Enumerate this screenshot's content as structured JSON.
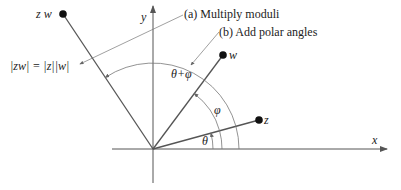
{
  "diagram": {
    "type": "complex-multiplication-geometry",
    "axes": {
      "x_label": "x",
      "y_label": "y"
    },
    "points": [
      {
        "id": "z",
        "label": "z"
      },
      {
        "id": "w",
        "label": "w"
      },
      {
        "id": "zw",
        "label": "z w"
      }
    ],
    "angles": [
      {
        "id": "theta",
        "label": "θ"
      },
      {
        "id": "phi",
        "label": "φ"
      },
      {
        "id": "theta_plus_phi",
        "label": "θ+φ"
      }
    ],
    "annotations": {
      "a": "(a)  Multiply moduli",
      "b": "(b)  Add polar angles",
      "modulus_formula": "|zw| = |z||w|"
    },
    "colors": {
      "line": "#555555",
      "arc": "#777777",
      "point": "#111111",
      "text": "#222222"
    }
  }
}
